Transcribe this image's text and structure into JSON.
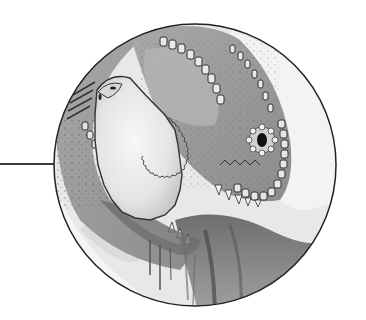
{
  "illustration": {
    "subject": "dinosaur-head-with-frill",
    "style": "grayscale watercolor and ink",
    "frame": {
      "shape": "circle",
      "center_x": 195,
      "center_y": 165,
      "radius": 141,
      "stroke_color": "#222222"
    },
    "callout": {
      "from_x": 0,
      "to_x": 57,
      "y": 164,
      "color": "#3a3a3a"
    },
    "palette": {
      "background": "#ffffff",
      "skin_mid": "#9a9a9a",
      "skin_light": "#c8c8c8",
      "frill_light": "#ececec",
      "shadow": "#555555",
      "ink": "#2a2a2a"
    }
  }
}
